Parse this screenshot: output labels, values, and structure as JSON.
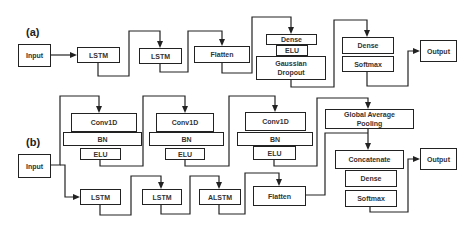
{
  "panels": {
    "a": {
      "label": "(a)",
      "nodes": {
        "input": "Input",
        "lstm1": "LSTM",
        "lstm2": "LSTM",
        "flatten": "Flatten",
        "dense1": "Dense",
        "elu": "ELU",
        "gaussian_dropout": "Gaussian Dropout",
        "dense2": "Dense",
        "softmax": "Softmax",
        "output": "Output"
      }
    },
    "b": {
      "label": "(b)",
      "nodes": {
        "input": "Input",
        "conv1": "Conv1D",
        "bn1": "BN",
        "elu1": "ELU",
        "conv2": "Conv1D",
        "bn2": "BN",
        "elu2": "ELU",
        "conv3": "Conv1D",
        "bn3": "BN",
        "elu3": "ELU",
        "gap": "Global Average Pooling",
        "lstm1": "LSTM",
        "lstm2": "LSTM",
        "alstm": "ALSTM",
        "flatten": "Flatten",
        "concatenate": "Concatenate",
        "dense": "Dense",
        "softmax": "Softmax",
        "output": "Output"
      }
    }
  },
  "edges": {
    "a": [
      [
        "input",
        "lstm1"
      ],
      [
        "lstm1",
        "lstm2"
      ],
      [
        "lstm2",
        "flatten"
      ],
      [
        "flatten",
        "dense1"
      ],
      [
        "gaussian_dropout",
        "dense2"
      ],
      [
        "softmax",
        "output"
      ]
    ],
    "b": [
      [
        "input",
        "conv1"
      ],
      [
        "input",
        "lstm1"
      ],
      [
        "elu1",
        "conv2"
      ],
      [
        "elu2",
        "conv3"
      ],
      [
        "elu3",
        "gap"
      ],
      [
        "gap",
        "concatenate"
      ],
      [
        "lstm1",
        "lstm2"
      ],
      [
        "lstm2",
        "alstm"
      ],
      [
        "alstm",
        "flatten"
      ],
      [
        "flatten",
        "concatenate"
      ],
      [
        "softmax",
        "output"
      ]
    ]
  }
}
